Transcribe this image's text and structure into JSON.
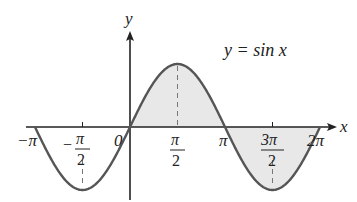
{
  "chart_data": {
    "type": "line",
    "title": "",
    "function": "y = sin x",
    "annotation": "y = sin x",
    "xlabel": "x",
    "ylabel": "y",
    "xlim": [
      -3.14159,
      6.28319
    ],
    "ylim": [
      -1,
      1
    ],
    "x_ticks": [
      {
        "value": -3.14159,
        "label": "-π"
      },
      {
        "value": -1.5708,
        "label": "-π/2"
      },
      {
        "value": 0,
        "label": "0"
      },
      {
        "value": 1.5708,
        "label": "π/2"
      },
      {
        "value": 3.14159,
        "label": "π"
      },
      {
        "value": 4.71239,
        "label": "3π/2"
      },
      {
        "value": 6.28319,
        "label": "2π"
      }
    ],
    "series": [
      {
        "name": "sin x",
        "x": [
          -3.14159,
          -2.35619,
          -1.5708,
          -0.7854,
          0,
          0.7854,
          1.5708,
          2.35619,
          3.14159,
          3.92699,
          4.71239,
          5.49779,
          6.28319
        ],
        "values": [
          0,
          -0.7071,
          -1,
          -0.7071,
          0,
          0.7071,
          1,
          0.7071,
          0,
          -0.7071,
          -1,
          -0.7071,
          0
        ]
      }
    ],
    "shaded_region": {
      "from": 0,
      "to": 6.28319,
      "between": "curve and x-axis",
      "color": "#e6e6e6"
    },
    "dashed_guides": [
      1.5708,
      -1.5708,
      4.71239
    ],
    "grid": false,
    "legend": "none"
  },
  "labels": {
    "y_axis": "y",
    "x_axis": "x",
    "equation": "y = sin x",
    "tick_neg_pi": "−π",
    "tick_neg_half_pi_num": "π",
    "tick_neg_half_pi_den": "2",
    "tick_neg_sign": "−",
    "tick_zero": "0",
    "tick_half_pi_num": "π",
    "tick_half_pi_den": "2",
    "tick_pi": "π",
    "tick_three_half_pi_num": "3π",
    "tick_three_half_pi_den": "2",
    "tick_two_pi": "2π"
  },
  "colors": {
    "curve": "#555555",
    "axis": "#222222",
    "shade": "#e8e8e8"
  }
}
